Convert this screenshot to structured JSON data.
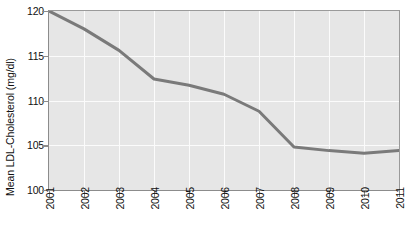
{
  "chart_data": {
    "type": "line",
    "title": "",
    "subtitle": "",
    "xlabel": "",
    "ylabel": "Mean LDL-Cholesterol (mg/dl)",
    "x": [
      2001,
      2002,
      2003,
      2004,
      2005,
      2006,
      2007,
      2008,
      2009,
      2010,
      2011
    ],
    "categories": [
      "2001",
      "2002",
      "2003",
      "2004",
      "2005",
      "2006",
      "2007",
      "2008",
      "2009",
      "2010",
      "2011"
    ],
    "values": [
      120.0,
      118.0,
      115.6,
      112.4,
      111.7,
      110.7,
      108.8,
      104.8,
      104.4,
      104.1,
      104.4
    ],
    "series": [
      {
        "name": "Mean LDL-Cholesterol",
        "values": [
          120.0,
          118.0,
          115.6,
          112.4,
          111.7,
          110.7,
          108.8,
          104.8,
          104.4,
          104.1,
          104.4
        ]
      }
    ],
    "xlim": [
      2001,
      2011
    ],
    "ylim": [
      100,
      120
    ],
    "ytick_labels": [
      "100",
      "105",
      "110",
      "115",
      "120"
    ],
    "ytick_values": [
      100,
      105,
      110,
      115,
      120
    ],
    "xtick_labels": [
      "2001",
      "2002",
      "2003",
      "2004",
      "2005",
      "2006",
      "2007",
      "2008",
      "2009",
      "2010",
      "2011"
    ],
    "grid": true,
    "grid_color": "#fbfbfb",
    "plot_background": "#e6e6e6",
    "line_color": "#7a7a7a",
    "line_width": 3,
    "legend": false,
    "legend_position": "none",
    "annotations": []
  },
  "axis": {
    "y_title": "Mean LDL-Cholesterol (mg/dl)"
  }
}
